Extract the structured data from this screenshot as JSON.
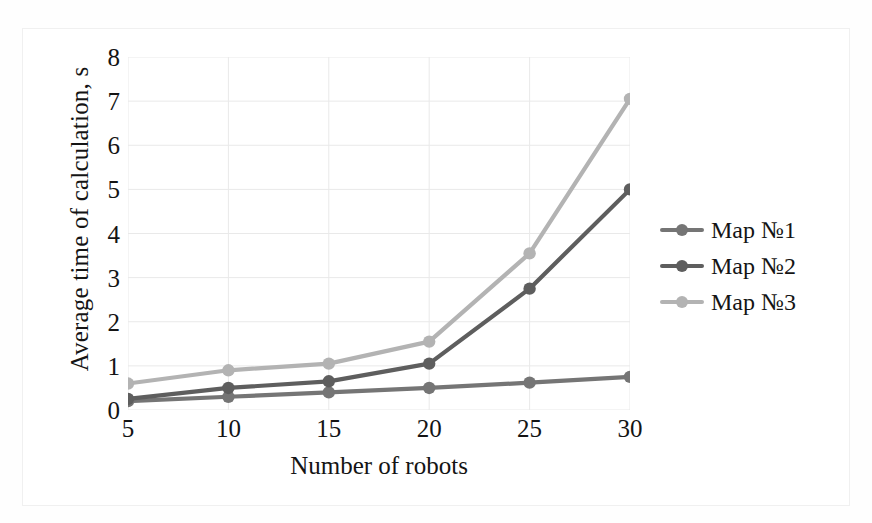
{
  "chart_data": {
    "type": "line",
    "title": "",
    "xlabel": "Number of robots",
    "ylabel": "Average time of calculation, s",
    "x": [
      5,
      10,
      15,
      20,
      25,
      30
    ],
    "categories": [
      "5",
      "10",
      "15",
      "20",
      "25",
      "30"
    ],
    "xlim": [
      5,
      30
    ],
    "ylim": [
      0,
      8
    ],
    "ytick_labels": [
      "0",
      "1",
      "2",
      "3",
      "4",
      "5",
      "6",
      "7",
      "8"
    ],
    "ytick_values": [
      0,
      1,
      2,
      3,
      4,
      5,
      6,
      7,
      8
    ],
    "grid": true,
    "grid_color": "#e9e9e9",
    "legend_position": "right",
    "series": [
      {
        "name": "Map №1",
        "values": [
          0.2,
          0.3,
          0.4,
          0.5,
          0.62,
          0.75
        ],
        "color": "#757575",
        "marker": "circle"
      },
      {
        "name": "Map №2",
        "values": [
          0.25,
          0.5,
          0.65,
          1.05,
          2.75,
          5.0
        ],
        "color": "#5e5e5e",
        "marker": "circle"
      },
      {
        "name": "Map №3",
        "values": [
          0.6,
          0.9,
          1.05,
          1.55,
          3.55,
          7.05
        ],
        "color": "#b3b3b3",
        "marker": "circle"
      }
    ]
  },
  "legend": {
    "items": [
      {
        "label": "Map №1",
        "color": "#757575"
      },
      {
        "label": "Map №2",
        "color": "#5e5e5e"
      },
      {
        "label": "Map №3",
        "color": "#b3b3b3"
      }
    ]
  },
  "axes": {
    "x_title": "Number of robots",
    "y_title": "Average time of calculation, s"
  }
}
